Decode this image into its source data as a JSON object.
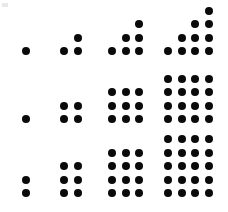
{
  "figure": {
    "background_color": "#ffffff",
    "dot_color": "#0a0a0a",
    "width": 228,
    "height": 212,
    "dot_diameter": 8,
    "dot_spacing": 13.5
  },
  "chart_data": {
    "type": "scatter",
    "subtitle": "",
    "xlabel": "",
    "ylabel": "",
    "grid": false,
    "legend_position": "none",
    "series": [
      {
        "name": "Triangular numbers",
        "row_index": 0,
        "formula": "n(n+1)/2",
        "values": [
          1,
          3,
          6,
          10
        ],
        "terms": [
          {
            "n": 1,
            "count": 1,
            "shape": "staircase",
            "columns": [
              1
            ],
            "origin_x": 26,
            "origin_y": 51,
            "baseline_y": 51
          },
          {
            "n": 2,
            "count": 3,
            "shape": "staircase",
            "columns": [
              1,
              2
            ],
            "origin_x": 64,
            "origin_y": 51,
            "baseline_y": 51
          },
          {
            "n": 3,
            "count": 6,
            "shape": "staircase",
            "columns": [
              1,
              2,
              3
            ],
            "origin_x": 112,
            "origin_y": 51,
            "baseline_y": 51
          },
          {
            "n": 4,
            "count": 10,
            "shape": "staircase",
            "columns": [
              1,
              2,
              3,
              4
            ],
            "origin_x": 168,
            "origin_y": 51,
            "baseline_y": 51
          }
        ]
      },
      {
        "name": "Square numbers",
        "row_index": 1,
        "formula": "n^2",
        "values": [
          1,
          4,
          9,
          16
        ],
        "terms": [
          {
            "n": 1,
            "count": 1,
            "shape": "rectangle",
            "cols": 1,
            "rows": 1,
            "origin_x": 26,
            "origin_y": 119,
            "baseline_y": 119
          },
          {
            "n": 2,
            "count": 4,
            "shape": "rectangle",
            "cols": 2,
            "rows": 2,
            "origin_x": 64,
            "origin_y": 119,
            "baseline_y": 119
          },
          {
            "n": 3,
            "count": 9,
            "shape": "rectangle",
            "cols": 3,
            "rows": 3,
            "origin_x": 112,
            "origin_y": 119,
            "baseline_y": 119
          },
          {
            "n": 4,
            "count": 16,
            "shape": "rectangle",
            "cols": 4,
            "rows": 4,
            "origin_x": 168,
            "origin_y": 119,
            "baseline_y": 119
          }
        ]
      },
      {
        "name": "Oblong numbers",
        "row_index": 2,
        "formula": "n(n+1)",
        "values": [
          2,
          6,
          12,
          20
        ],
        "terms": [
          {
            "n": 1,
            "count": 2,
            "shape": "rectangle",
            "cols": 1,
            "rows": 2,
            "origin_x": 26,
            "origin_y": 193,
            "baseline_y": 193
          },
          {
            "n": 2,
            "count": 6,
            "shape": "rectangle",
            "cols": 2,
            "rows": 3,
            "origin_x": 64,
            "origin_y": 193,
            "baseline_y": 193
          },
          {
            "n": 3,
            "count": 12,
            "shape": "rectangle",
            "cols": 3,
            "rows": 4,
            "origin_x": 112,
            "origin_y": 193,
            "baseline_y": 193
          },
          {
            "n": 4,
            "count": 20,
            "shape": "rectangle",
            "cols": 4,
            "rows": 5,
            "origin_x": 168,
            "origin_y": 193,
            "baseline_y": 193
          }
        ]
      }
    ]
  }
}
